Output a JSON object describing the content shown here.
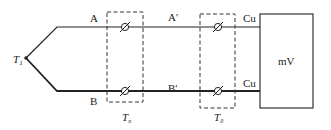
{
  "diagram": {
    "junction": {
      "label": "T",
      "subscript": "1"
    },
    "wires": {
      "upper_thermo": "A",
      "lower_thermo": "B",
      "upper_comp": "A'",
      "lower_comp": "B'",
      "upper_copper": "Cu",
      "lower_copper": "Cu"
    },
    "junction_boxes": [
      {
        "label": "T",
        "subscript": "n"
      },
      {
        "label": "T",
        "subscript": "0"
      }
    ],
    "meter": {
      "label": "mV"
    },
    "colors": {
      "line": "#222222",
      "dashed": "#333333",
      "background": "#ffffff"
    }
  }
}
